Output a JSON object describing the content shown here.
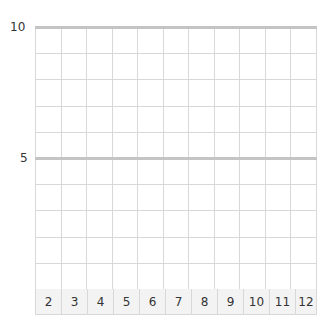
{
  "chart_data": {
    "type": "bar",
    "title": "",
    "xlabel": "",
    "ylabel": "",
    "categories": [
      "2",
      "3",
      "4",
      "5",
      "6",
      "7",
      "8",
      "9",
      "10",
      "11",
      "12"
    ],
    "values": [
      0,
      0,
      0,
      0,
      0,
      0,
      0,
      0,
      0,
      0,
      0
    ],
    "ylim": [
      0,
      10
    ],
    "yticks": [
      "10",
      "5"
    ],
    "grid": true,
    "rows": 10,
    "legend": null
  },
  "axis": {
    "y_top": "10",
    "y_mid": "5"
  },
  "colors": {
    "grid": "#d8d8d8",
    "major_line": "#c4c4c4",
    "label_row_bg": "#f3f3f3"
  }
}
